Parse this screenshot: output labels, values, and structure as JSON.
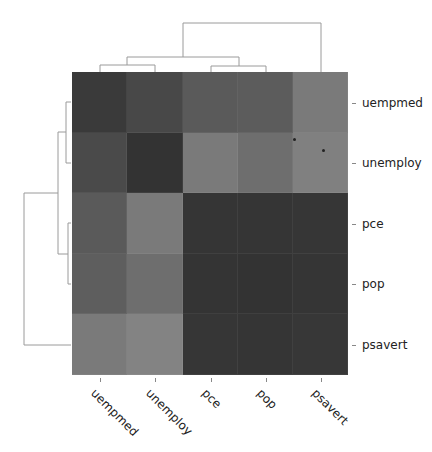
{
  "chart_data": {
    "type": "heatmap",
    "subtype": "clustermap",
    "title": "",
    "variables": [
      "uempmed",
      "unemploy",
      "pce",
      "pop",
      "psavert"
    ],
    "row_labels": [
      "uempmed",
      "unemploy",
      "pce",
      "pop",
      "psavert"
    ],
    "col_labels": [
      "uempmed",
      "unemploy",
      "pce",
      "pop",
      "psavert"
    ],
    "colormap": "grayscale",
    "cell_colors": [
      [
        "#3a3a3a",
        "#484848",
        "#5a5a5a",
        "#5c5c5c",
        "#7a7a7a"
      ],
      [
        "#4a4a4a",
        "#333333",
        "#7a7a7a",
        "#6e6e6e",
        "#808080"
      ],
      [
        "#5a5a5a",
        "#7a7a7a",
        "#353535",
        "#353535",
        "#363636"
      ],
      [
        "#5e5e5e",
        "#6e6e6e",
        "#343434",
        "#333333",
        "#353535"
      ],
      [
        "#7a7a7a",
        "#838383",
        "#363636",
        "#353535",
        "#373737"
      ]
    ],
    "dendrogram": {
      "row": {
        "order": [
          "uempmed",
          "unemploy",
          "pce",
          "pop",
          "psavert"
        ],
        "clusters": [
          [
            "uempmed",
            "unemploy"
          ],
          [
            "pce",
            "pop"
          ],
          [
            [
              "uempmed",
              "unemploy"
            ],
            [
              "pce",
              "pop"
            ]
          ],
          [
            [
              [
                "uempmed",
                "unemploy"
              ],
              [
                "pce",
                "pop"
              ]
            ],
            "psavert"
          ]
        ]
      },
      "col": {
        "order": [
          "uempmed",
          "unemploy",
          "pce",
          "pop",
          "psavert"
        ],
        "clusters": [
          [
            "uempmed",
            "unemploy"
          ],
          [
            "pce",
            "pop"
          ],
          [
            [
              "uempmed",
              "unemploy"
            ],
            [
              "pce",
              "pop"
            ]
          ],
          [
            [
              [
                "uempmed",
                "unemploy"
              ],
              [
                "pce",
                "pop"
              ]
            ],
            "psavert"
          ]
        ]
      }
    },
    "legend": "none",
    "grid": false
  },
  "dendro_color": "#9a9a9a",
  "markers": [
    {
      "x": 294,
      "y": 139
    },
    {
      "x": 323,
      "y": 150
    }
  ]
}
